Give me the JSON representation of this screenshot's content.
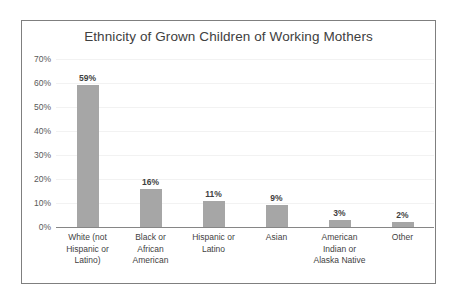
{
  "chart_data": {
    "type": "bar",
    "title": "Ethnicity of Grown Children of Working Mothers",
    "xlabel": "",
    "ylabel": "",
    "ylim": [
      0,
      70
    ],
    "grid": true,
    "legend": "none",
    "y_ticks": [
      "0%",
      "10%",
      "20%",
      "30%",
      "40%",
      "50%",
      "60%",
      "70%"
    ],
    "y_tick_values": [
      0,
      10,
      20,
      30,
      40,
      50,
      60,
      70
    ],
    "categories": [
      "White (not Hispanic or Latino)",
      "Black or African American",
      "Hispanic or Latino",
      "Asian",
      "American Indian or Alaska Native",
      "Other"
    ],
    "category_lines": [
      [
        "White (not",
        "Hispanic or",
        "Latino)"
      ],
      [
        "Black or",
        "African",
        "American"
      ],
      [
        "Hispanic or",
        "Latino"
      ],
      [
        "Asian"
      ],
      [
        "American",
        "Indian or",
        "Alaska Native"
      ],
      [
        "Other"
      ]
    ],
    "values": [
      59,
      16,
      11,
      9,
      3,
      2
    ],
    "data_labels": [
      "59%",
      "16%",
      "11%",
      "9%",
      "3%",
      "2%"
    ],
    "colors": {
      "bar_fill": "#a6a6a6",
      "gridline": "#f2f2f2",
      "axis_line": "#868686",
      "title_text": "#404040",
      "label_text": "#3f3f3f",
      "tick_text": "#595959",
      "frame_border": "#7f7f7f",
      "background": "#ffffff"
    }
  }
}
